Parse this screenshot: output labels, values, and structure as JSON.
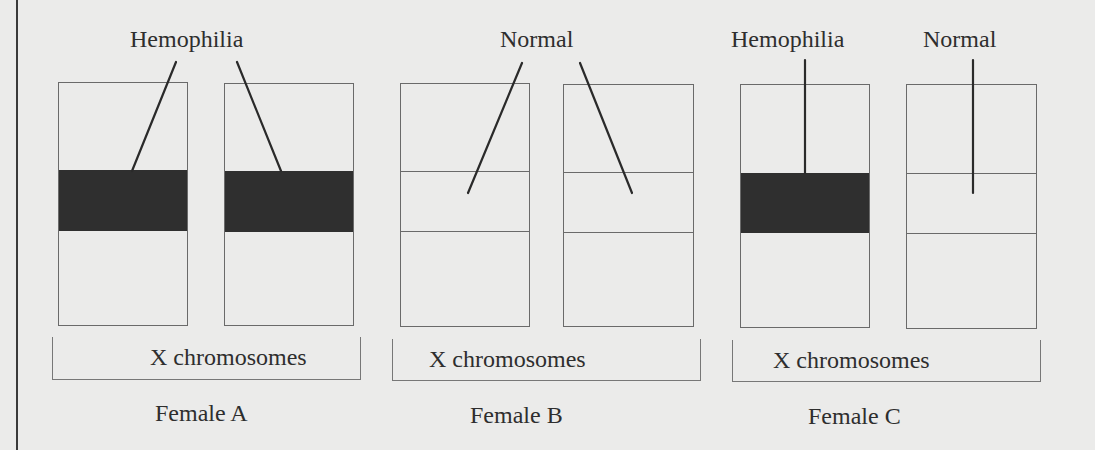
{
  "figure": {
    "page_edge_x": 16,
    "band_color": "#2f2f2f",
    "bracket_label": "X chromosomes",
    "groups": [
      {
        "name": "Female A",
        "allele_labels": [
          {
            "text": "Hemophilia",
            "x": 130,
            "y": 27
          }
        ],
        "bracket": {
          "x": 52,
          "y": 337,
          "w": 309,
          "h": 43,
          "label_x": 150
        },
        "caption_x": 155,
        "chromosomes": [
          {
            "x": 58,
            "y": 82,
            "w": 130,
            "h": 244,
            "band_top": 88,
            "band_h": 61,
            "allele": "hemophilia"
          },
          {
            "x": 224,
            "y": 83,
            "w": 130,
            "h": 243,
            "band_top": 88,
            "band_h": 61,
            "allele": "hemophilia"
          }
        ],
        "pointers": [
          {
            "x1": 176,
            "y1": 62,
            "x2": 132,
            "y2": 171
          },
          {
            "x1": 237,
            "y1": 62,
            "x2": 281,
            "y2": 171
          }
        ]
      },
      {
        "name": "Female B",
        "allele_labels": [
          {
            "text": "Normal",
            "x": 500,
            "y": 27
          }
        ],
        "bracket": {
          "x": 392,
          "y": 339,
          "w": 309,
          "h": 42,
          "label_x": 429
        },
        "caption_x": 470,
        "chromosomes": [
          {
            "x": 400,
            "y": 83,
            "w": 130,
            "h": 244,
            "band_top": 88,
            "band_h": 60,
            "allele": "normal"
          },
          {
            "x": 563,
            "y": 84,
            "w": 131,
            "h": 243,
            "band_top": 88,
            "band_h": 60,
            "allele": "normal"
          }
        ],
        "pointers": [
          {
            "x1": 522,
            "y1": 63,
            "x2": 468,
            "y2": 193
          },
          {
            "x1": 580,
            "y1": 63,
            "x2": 632,
            "y2": 193
          }
        ]
      },
      {
        "name": "Female C",
        "allele_labels": [
          {
            "text": "Hemophilia",
            "x": 731,
            "y": 27
          },
          {
            "text": "Normal",
            "x": 923,
            "y": 27
          }
        ],
        "bracket": {
          "x": 732,
          "y": 340,
          "w": 309,
          "h": 42,
          "label_x": 773
        },
        "caption_x": 808,
        "chromosomes": [
          {
            "x": 740,
            "y": 84,
            "w": 130,
            "h": 244,
            "band_top": 88,
            "band_h": 60,
            "allele": "hemophilia"
          },
          {
            "x": 906,
            "y": 84,
            "w": 131,
            "h": 245,
            "band_top": 89,
            "band_h": 60,
            "allele": "normal"
          }
        ],
        "pointers": [
          {
            "x1": 805,
            "y1": 60,
            "x2": 805,
            "y2": 173
          },
          {
            "x1": 973,
            "y1": 60,
            "x2": 973,
            "y2": 193
          }
        ]
      }
    ]
  },
  "labels": {
    "hemophilia": "Hemophilia",
    "normal": "Normal",
    "x_chromosomes": "X chromosomes",
    "female_a": "Female A",
    "female_b": "Female B",
    "female_c": "Female C"
  }
}
